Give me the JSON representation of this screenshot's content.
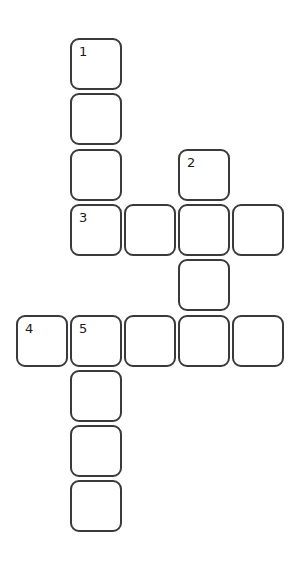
{
  "puzzle": {
    "type": "crossword",
    "layout": {
      "origin_x": 16,
      "origin_y": 38,
      "pitch_x": 54,
      "pitch_y": 55.3,
      "cell_size": 52
    },
    "cells": [
      {
        "row": 0,
        "col": 1,
        "number": "1",
        "value": ""
      },
      {
        "row": 1,
        "col": 1,
        "number": "",
        "value": ""
      },
      {
        "row": 2,
        "col": 1,
        "number": "",
        "value": ""
      },
      {
        "row": 2,
        "col": 3,
        "number": "2",
        "value": ""
      },
      {
        "row": 3,
        "col": 1,
        "number": "3",
        "value": ""
      },
      {
        "row": 3,
        "col": 2,
        "number": "",
        "value": ""
      },
      {
        "row": 3,
        "col": 3,
        "number": "",
        "value": ""
      },
      {
        "row": 3,
        "col": 4,
        "number": "",
        "value": ""
      },
      {
        "row": 4,
        "col": 3,
        "number": "",
        "value": ""
      },
      {
        "row": 5,
        "col": 0,
        "number": "4",
        "value": ""
      },
      {
        "row": 5,
        "col": 1,
        "number": "5",
        "value": ""
      },
      {
        "row": 5,
        "col": 2,
        "number": "",
        "value": ""
      },
      {
        "row": 5,
        "col": 3,
        "number": "",
        "value": ""
      },
      {
        "row": 5,
        "col": 4,
        "number": "",
        "value": ""
      },
      {
        "row": 6,
        "col": 1,
        "number": "",
        "value": ""
      },
      {
        "row": 7,
        "col": 1,
        "number": "",
        "value": ""
      },
      {
        "row": 8,
        "col": 1,
        "number": "",
        "value": ""
      }
    ],
    "entries": {
      "down": [
        {
          "number": "1",
          "row": 0,
          "col": 1,
          "length": 4
        },
        {
          "number": "2",
          "row": 2,
          "col": 3,
          "length": 4
        },
        {
          "number": "5",
          "row": 5,
          "col": 1,
          "length": 4
        }
      ],
      "across": [
        {
          "number": "3",
          "row": 3,
          "col": 1,
          "length": 4
        },
        {
          "number": "4",
          "row": 5,
          "col": 0,
          "length": 5
        }
      ]
    },
    "colors": {
      "cell_border": "#3a3a3a",
      "cell_fill": "#ffffff",
      "number_text": "#1a1a1a",
      "background": "#ffffff"
    }
  }
}
